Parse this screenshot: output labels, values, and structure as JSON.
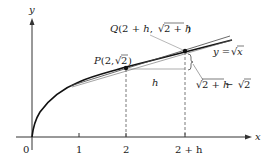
{
  "diagram": {
    "type": "function-graph",
    "function_label": "y = √x",
    "axes": {
      "x_label": "x",
      "y_label": "y",
      "origin_label": "0",
      "ticks": [
        "1",
        "2",
        "2 + h"
      ]
    },
    "points": {
      "P": {
        "label": "P(2, √2)",
        "x": "2",
        "y": "√2"
      },
      "Q": {
        "label": "Q(2 + h, √(2+h))",
        "x": "2 + h",
        "y": "√(2+h)"
      }
    },
    "annotations": {
      "horizontal_gap": "h",
      "vertical_gap": "√(2+h) − √2"
    },
    "colors": {
      "curve": "#111111",
      "axes": "#333333",
      "secant": "#555555",
      "guides": "#555555"
    }
  },
  "labels": {
    "y_axis": "y",
    "x_axis": "x",
    "origin": "0",
    "tick_1": "1",
    "tick_2": "2",
    "tick_2h": "2 + h",
    "P_prefix": "P(2, ",
    "P_root": "2",
    "P_suffix": ")",
    "Q_prefix": "Q(2 + h, ",
    "Q_root": "2 + h",
    "Q_suffix": ")",
    "curve_prefix": "y = ",
    "curve_root": "x",
    "h": "h",
    "rise_root1": "2 + h",
    "rise_minus": " − ",
    "rise_root2": "2"
  }
}
